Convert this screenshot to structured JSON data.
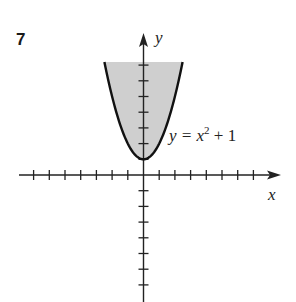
{
  "problem": {
    "number": "7"
  },
  "chart_data": {
    "type": "area",
    "title": "",
    "xlabel": "x",
    "ylabel": "y",
    "curve": {
      "equation": "y = x^2 + 1",
      "label_base": "y = x",
      "label_exp": "2",
      "label_tail": " + 1"
    },
    "shaded_region": "y >= x^2 + 1 (region above the parabola, shown up to y ≈ 7.2)",
    "x": [
      -2.49,
      -2,
      -1.5,
      -1,
      -0.5,
      0,
      0.5,
      1,
      1.5,
      2,
      2.49
    ],
    "y": [
      7.2,
      5,
      3.25,
      2,
      1.25,
      1,
      1.25,
      2,
      3.25,
      5,
      7.2
    ],
    "xlim": [
      -8,
      8.5
    ],
    "ylim": [
      -8,
      9
    ],
    "x_ticks_left": 7,
    "x_ticks_right": 7,
    "y_ticks_up": 7,
    "y_ticks_down": 7,
    "tick_labels": "none",
    "grid": false,
    "colors": {
      "fill": "#cfcfcf",
      "curve": "#111111",
      "axis": "#222222"
    }
  }
}
